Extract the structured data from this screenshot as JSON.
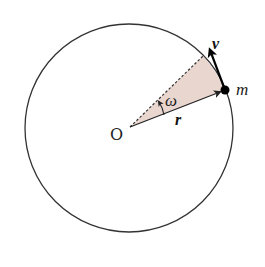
{
  "diagram": {
    "colors": {
      "background": "#ffffff",
      "stroke": "#222222",
      "sector_fill": "#e8d6cf",
      "dot": "#000000"
    },
    "circle": {
      "cx": 129,
      "cy": 128,
      "r": 104
    },
    "origin": {
      "x": 130,
      "y": 127
    },
    "mass_point": {
      "x": 225,
      "y": 90,
      "r": 4.5
    },
    "dashed_end": {
      "x": 203,
      "y": 56
    },
    "velocity_tip": {
      "x": 209,
      "y": 48
    },
    "labels": {
      "origin": "O",
      "mass": "m",
      "velocity": "v",
      "radius": "r",
      "angular_velocity": "ω"
    }
  }
}
